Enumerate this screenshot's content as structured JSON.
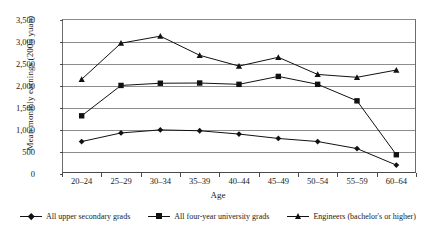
{
  "chart_data": {
    "type": "line",
    "title": "",
    "xlabel": "Age",
    "ylabel": "Mean monthly earnings (2005 yuan)",
    "categories": [
      "20–24",
      "25–29",
      "30–34",
      "35–39",
      "40–44",
      "45–49",
      "50–54",
      "55–59",
      "60–64"
    ],
    "ylim": [
      0,
      3500
    ],
    "yticks": [
      0,
      500,
      1000,
      1500,
      2000,
      2500,
      3000,
      3500
    ],
    "ytick_labels": [
      "0",
      "500",
      "1,000",
      "1,500",
      "2,000",
      "2,500",
      "3,000",
      "3,500"
    ],
    "grid": "horizontal",
    "legend_position": "bottom",
    "series": [
      {
        "name": "All upper secondary grads",
        "marker": "diamond",
        "color": "#111111",
        "values": [
          715,
          910,
          980,
          960,
          885,
          785,
          715,
          555,
          180
        ]
      },
      {
        "name": "All four-year university grads",
        "marker": "square",
        "color": "#111111",
        "values": [
          1300,
          1990,
          2040,
          2045,
          2015,
          2195,
          2015,
          1640,
          415
        ]
      },
      {
        "name": "Engineers (bachelor's or higher)",
        "marker": "triangle",
        "color": "#111111",
        "values": [
          2130,
          2950,
          3110,
          2675,
          2430,
          2630,
          2240,
          2175,
          2340
        ]
      }
    ]
  }
}
